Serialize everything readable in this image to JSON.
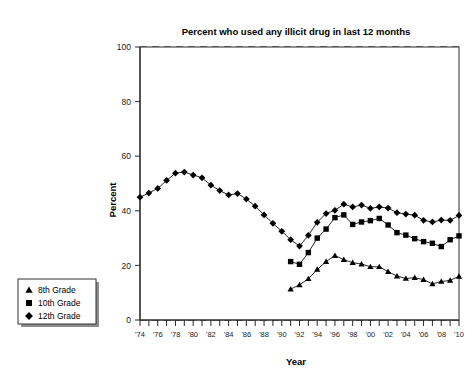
{
  "chart_data": {
    "type": "line",
    "title": "Percent who used any illicit drug in last 12 months",
    "xlabel": "Year",
    "ylabel": "Percent",
    "ylim": [
      0,
      100
    ],
    "yticks": [
      0,
      20,
      40,
      60,
      80,
      100
    ],
    "ytick_labels": [
      "0",
      "20",
      "40",
      "60",
      "80",
      "100"
    ],
    "xlim": [
      1974,
      2010
    ],
    "xticks": [
      1974,
      1975,
      1976,
      1977,
      1978,
      1979,
      1980,
      1981,
      1982,
      1983,
      1984,
      1985,
      1986,
      1987,
      1988,
      1989,
      1990,
      1991,
      1992,
      1993,
      1994,
      1995,
      1996,
      1997,
      1998,
      1999,
      2000,
      2001,
      2002,
      2003,
      2004,
      2005,
      2006,
      2007,
      2008,
      2009,
      2010
    ],
    "xtick_labels": [
      "'74",
      "",
      "'76",
      "",
      "'78",
      "",
      "'80",
      "",
      "'82",
      "",
      "'84",
      "",
      "'86",
      "",
      "'88",
      "",
      "'90",
      "",
      "'92",
      "",
      "'94",
      "",
      "'96",
      "",
      "'98",
      "",
      "'00",
      "",
      "'02",
      "",
      "'04",
      "",
      "'06",
      "",
      "'08",
      "",
      "'10"
    ],
    "grid": true,
    "grid_axis": "y",
    "legend_position": "outside-lower-left",
    "series": [
      {
        "name": "8th Grade",
        "marker": "triangle",
        "color": "#000000",
        "x": [
          1991,
          1992,
          1993,
          1994,
          1995,
          1996,
          1997,
          1998,
          1999,
          2000,
          2001,
          2002,
          2003,
          2004,
          2005,
          2006,
          2007,
          2008,
          2009,
          2010
        ],
        "values": [
          11.3,
          12.9,
          15.1,
          18.5,
          21.4,
          23.6,
          22.1,
          21.0,
          20.5,
          19.5,
          19.5,
          17.7,
          16.1,
          15.2,
          15.5,
          14.8,
          13.2,
          14.1,
          14.5,
          16.0
        ]
      },
      {
        "name": "10th Grade",
        "marker": "square",
        "color": "#000000",
        "x": [
          1991,
          1992,
          1993,
          1994,
          1995,
          1996,
          1997,
          1998,
          1999,
          2000,
          2001,
          2002,
          2003,
          2004,
          2005,
          2006,
          2007,
          2008,
          2009,
          2010
        ],
        "values": [
          21.4,
          20.4,
          24.7,
          30.0,
          33.3,
          37.5,
          38.5,
          35.0,
          35.9,
          36.4,
          37.2,
          34.8,
          32.0,
          31.1,
          29.8,
          28.7,
          28.1,
          26.9,
          29.4,
          30.8
        ]
      },
      {
        "name": "12th Grade",
        "marker": "diamond",
        "color": "#000000",
        "x": [
          1974,
          1975,
          1976,
          1977,
          1978,
          1979,
          1980,
          1981,
          1982,
          1983,
          1984,
          1985,
          1986,
          1987,
          1988,
          1989,
          1990,
          1991,
          1992,
          1993,
          1994,
          1995,
          1996,
          1997,
          1998,
          1999,
          2000,
          2001,
          2002,
          2003,
          2004,
          2005,
          2006,
          2007,
          2008,
          2009,
          2010
        ],
        "values": [
          45.0,
          46.5,
          48.2,
          51.1,
          53.8,
          54.2,
          53.1,
          52.1,
          49.4,
          47.4,
          45.8,
          46.3,
          44.3,
          41.7,
          38.5,
          35.4,
          32.5,
          29.4,
          27.1,
          31.0,
          35.8,
          39.0,
          40.2,
          42.4,
          41.4,
          42.1,
          40.9,
          41.4,
          41.0,
          39.3,
          38.8,
          38.4,
          36.5,
          35.9,
          36.6,
          36.5,
          38.3
        ]
      }
    ]
  },
  "legend": {
    "items": [
      {
        "label": "8th Grade",
        "marker": "triangle"
      },
      {
        "label": "10th Grade",
        "marker": "square"
      },
      {
        "label": "12th Grade",
        "marker": "diamond"
      }
    ]
  }
}
